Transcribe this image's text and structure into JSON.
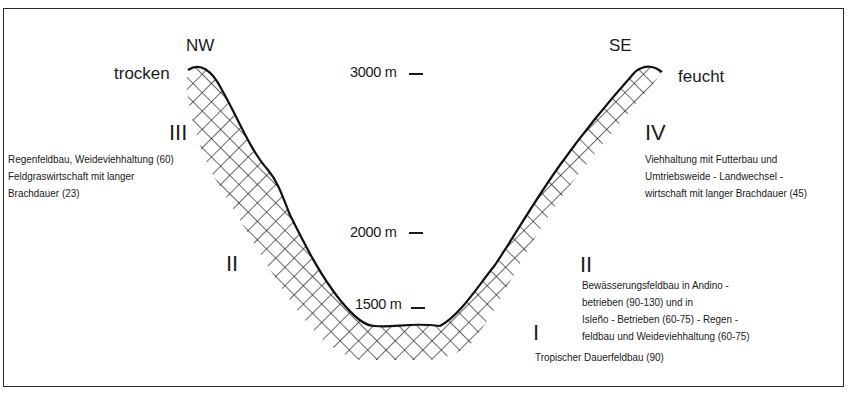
{
  "diagram": {
    "type": "altitudinal land-use profile",
    "directions": {
      "left": "NW",
      "right": "SE"
    },
    "climate": {
      "left": "trocken",
      "right": "feucht"
    },
    "altitudes": [
      {
        "label": "3000 m",
        "value": 3000
      },
      {
        "label": "2000 m",
        "value": 2000
      },
      {
        "label": "1500 m",
        "value": 1500
      }
    ],
    "zones": {
      "left_III": {
        "numeral": "III",
        "lines": [
          "Regenfeldbau, Weideviehhaltung (60)",
          "Feldgraswirtschaft mit langer",
          "Brachdauer (23)"
        ]
      },
      "left_II": {
        "numeral": "II"
      },
      "right_IV": {
        "numeral": "IV",
        "lines": [
          "Viehhaltung mit Futterbau und",
          "Umtriebsweide - Landwechsel -",
          "wirtschaft mit langer Brachdauer (45)"
        ]
      },
      "right_II": {
        "numeral": "II",
        "lines": [
          "Bewässerungsfeldbau in Andino -",
          "betrieben  (90-130)   und in",
          "Isleño - Betrieben (60-75)  -  Regen -",
          "feldbau und Weideviehhaltung (60-75)"
        ]
      },
      "valley_I": {
        "numeral": "I",
        "lines": [
          "Tropischer Dauerfeldbau (90)"
        ]
      }
    },
    "colors": {
      "ink": "#1a1a1a",
      "background": "#ffffff"
    }
  }
}
